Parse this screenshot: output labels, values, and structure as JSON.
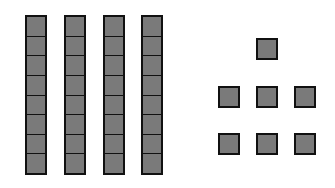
{
  "diagram": {
    "colors": {
      "fill": "#7a7a7a",
      "outline": "#111111",
      "background": "#ffffff"
    },
    "rods": [
      {
        "x": 25,
        "y": 15,
        "units": 8
      },
      {
        "x": 64,
        "y": 15,
        "units": 8
      },
      {
        "x": 103,
        "y": 15,
        "units": 8
      },
      {
        "x": 141,
        "y": 15,
        "units": 8
      }
    ],
    "rod_unit_height": 20,
    "singles": [
      {
        "x": 256,
        "y": 38
      },
      {
        "x": 218,
        "y": 86
      },
      {
        "x": 256,
        "y": 86
      },
      {
        "x": 294,
        "y": 86
      },
      {
        "x": 218,
        "y": 133
      },
      {
        "x": 256,
        "y": 133
      },
      {
        "x": 294,
        "y": 133
      }
    ],
    "counts": {
      "rods": 4,
      "units_per_rod": 8,
      "singles": 7
    }
  }
}
